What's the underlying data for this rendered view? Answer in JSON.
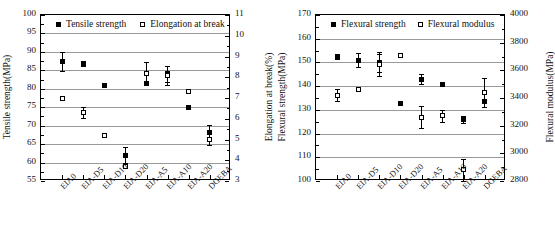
{
  "figure": {
    "panels": [
      "left",
      "right"
    ]
  },
  "chart_data": [
    {
      "type": "scatter",
      "title": "",
      "panel": "left",
      "categories": [
        "EIA0",
        "EIA-D5",
        "EIA-D10",
        "EIA-D20",
        "EIA-A5",
        "EIA-A10",
        "EIA-A20",
        "DGEBA"
      ],
      "xlabel": "",
      "ylabel": "Tensile strength(MPa)",
      "ylim": [
        55,
        100
      ],
      "yticks": [
        55,
        60,
        65,
        70,
        75,
        80,
        85,
        90,
        95,
        100
      ],
      "y2label": "Elongation at break(%)",
      "y2lim": [
        3,
        11
      ],
      "y2ticks": [
        3,
        4,
        5,
        6,
        7,
        8,
        9,
        10,
        11
      ],
      "grid": true,
      "legend_position": "top",
      "series": [
        {
          "name": "Tensile strength",
          "marker": "filled-square",
          "axis": "left",
          "values": [
            87.4,
            86.8,
            81.0,
            62.0,
            81.4,
            84.1,
            74.9,
            68.1
          ],
          "errors": [
            2.6,
            0.7,
            0.0,
            2.2,
            0.0,
            2.2,
            0.0,
            2.2
          ]
        },
        {
          "name": "Elongation at break",
          "marker": "open-square",
          "axis": "right",
          "values": [
            7.0,
            6.3,
            5.2,
            3.7,
            8.2,
            8.1,
            7.3,
            5.0
          ],
          "errors": [
            0.0,
            0.25,
            0.0,
            0.0,
            0.55,
            0.45,
            0.0,
            0.25
          ]
        }
      ]
    },
    {
      "type": "scatter",
      "title": "",
      "panel": "right",
      "categories": [
        "EIA0",
        "EIA-D5",
        "EIA-D10",
        "EIA-D20",
        "EIA-A5",
        "EIA-A10",
        "EIA-A20",
        "DGEBA"
      ],
      "xlabel": "",
      "ylabel": "Flexural strength(MPa)",
      "ylim": [
        100,
        170
      ],
      "yticks": [
        100,
        110,
        120,
        130,
        140,
        150,
        160,
        170
      ],
      "y2label": "Flexural modulus(MPa)",
      "y2lim": [
        2800,
        4000
      ],
      "y2ticks": [
        2800,
        3000,
        3200,
        3400,
        3600,
        3800,
        4000
      ],
      "grid": true,
      "legend_position": "top",
      "series": [
        {
          "name": "Flexural strength",
          "marker": "filled-square",
          "axis": "left",
          "values": [
            152.3,
            151.0,
            150.1,
            132.6,
            143.0,
            140.8,
            126.0,
            133.6
          ],
          "errors": [
            1.0,
            2.8,
            4.2,
            0.0,
            2.0,
            0.0,
            1.4,
            0.0
          ]
        },
        {
          "name": "Flexural modulus",
          "marker": "open-square",
          "axis": "right",
          "values": [
            3420,
            3460,
            3640,
            3710,
            3260,
            3270,
            2880,
            3440
          ],
          "errors": [
            45,
            0,
            80,
            0,
            80,
            40,
            80,
            105
          ]
        }
      ]
    }
  ]
}
